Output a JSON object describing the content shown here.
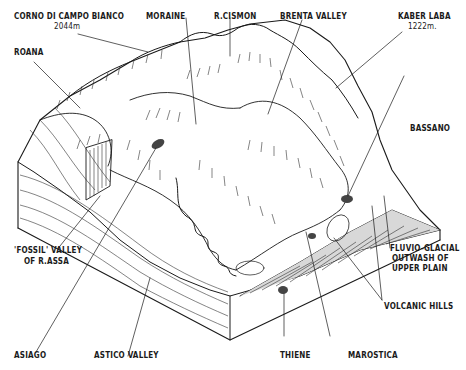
{
  "diagram": {
    "title": "",
    "type": "block-diagram",
    "labels": {
      "corno_di_campo_bianco": "CORNO DI CAMPO BIANCO",
      "corno_elevation": "2044m",
      "moraine": "MORAINE",
      "r_cismon": "R.CISMON",
      "brenta_valley": "BRENTA VALLEY",
      "kaber_laba": "KABER LABA",
      "kaber_elevation": "1222m.",
      "roana": "ROANA",
      "bassano": "BASSANO",
      "fluvio_glacial_1": "FLUVIO-GLACIAL",
      "fluvio_glacial_2": "OUTWASH OF",
      "fluvio_glacial_3": "UPPER PLAIN",
      "fossil_valley_1": "'FOSSIL' VALLEY",
      "fossil_valley_2": "OF R.ASSA",
      "volcanic_hills": "VOLCANIC HILLS",
      "asiago": "ASIAGO",
      "astico_valley": "ASTICO VALLEY",
      "thiene": "THIENE",
      "marostica": "MAROSTICA"
    }
  }
}
